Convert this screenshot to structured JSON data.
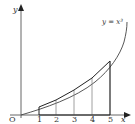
{
  "diagram": {
    "curve_label": "y = x³",
    "axis_x_label": "x",
    "axis_y_label": "y",
    "origin_label": "O",
    "x_ticks": [
      "1",
      "2",
      "3",
      "4",
      "5"
    ],
    "colors": {
      "axis": "#555555",
      "curve": "#333333",
      "ordinates": "#777777",
      "chords": "#222222"
    }
  }
}
